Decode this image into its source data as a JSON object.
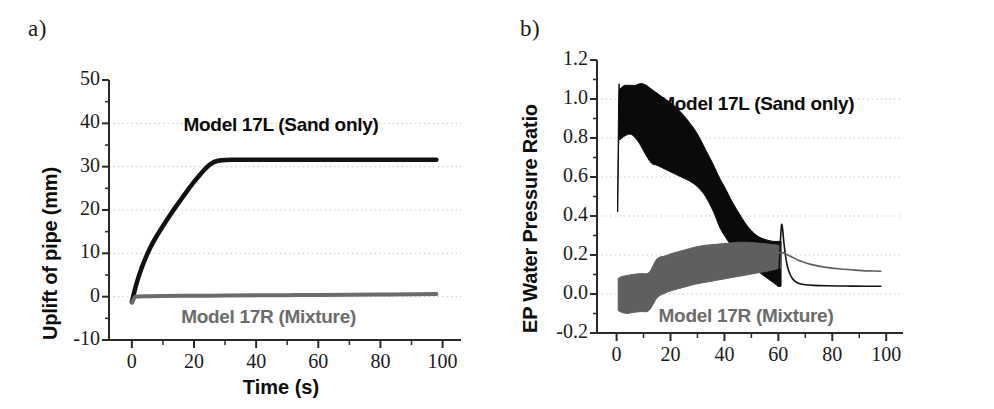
{
  "figure": {
    "panels": [
      {
        "tag": "a)",
        "chart_data": {
          "type": "line",
          "title": "",
          "xlabel": "Time (s)",
          "ylabel": "Uplift of pipe (mm)",
          "xlim": [
            -8,
            104
          ],
          "ylim": [
            -10,
            50
          ],
          "xticks": [
            0,
            20,
            40,
            60,
            80,
            100
          ],
          "xtick_labels": [
            "0",
            "20",
            "40",
            "60",
            "80",
            "100"
          ],
          "xminor_step": 10,
          "yticks": [
            -10,
            0,
            10,
            20,
            30,
            40,
            50
          ],
          "ytick_labels": [
            "-10",
            "0",
            "10",
            "20",
            "30",
            "40",
            "50"
          ],
          "yminor_step": 5,
          "grid": "horizontal-dotted",
          "legend": "inline-annotations",
          "annotations": [
            {
              "text": "Model 17L (Sand only)",
              "x": 48,
              "y": 39.5,
              "color": "#0a0a0a"
            },
            {
              "text": "Model 17R (Mixture)",
              "x": 44,
              "y": -5.0,
              "color": "#6b6b6b"
            }
          ],
          "series": [
            {
              "name": "Model 17L (Sand only)",
              "color": "#111111",
              "width": 4.5,
              "x": [
                0,
                0.6,
                1.5,
                2.5,
                4,
                6,
                8,
                10,
                12,
                14,
                16,
                18,
                20,
                22,
                24,
                26,
                27.5,
                29,
                32,
                36,
                42,
                50,
                60,
                70,
                80,
                90,
                98
              ],
              "y": [
                -1.2,
                0.6,
                3.0,
                5.3,
                8.2,
                11.4,
                14.0,
                16.3,
                18.5,
                20.6,
                22.6,
                24.6,
                26.5,
                28.2,
                29.8,
                30.9,
                31.3,
                31.5,
                31.6,
                31.6,
                31.6,
                31.6,
                31.6,
                31.6,
                31.6,
                31.6,
                31.6
              ]
            },
            {
              "name": "Model 17R (Mixture)",
              "color": "#6b6b6b",
              "width": 4.0,
              "x": [
                0,
                1,
                2,
                5,
                10,
                20,
                30,
                40,
                50,
                60,
                70,
                80,
                90,
                98
              ],
              "y": [
                -1.4,
                -0.1,
                0.05,
                0.1,
                0.15,
                0.2,
                0.25,
                0.3,
                0.35,
                0.4,
                0.45,
                0.5,
                0.55,
                0.6
              ]
            }
          ]
        }
      },
      {
        "tag": "b)",
        "chart_data": {
          "type": "area",
          "title": "",
          "xlabel": "",
          "ylabel": "EP Water Pressure Ratio",
          "xlim": [
            -8,
            104
          ],
          "ylim": [
            -0.2,
            1.2
          ],
          "xticks": [
            0,
            20,
            40,
            60,
            80,
            100
          ],
          "xtick_labels": [
            "0",
            "20",
            "40",
            "60",
            "80",
            "100"
          ],
          "xminor_step": 10,
          "yticks": [
            -0.2,
            0.0,
            0.2,
            0.4,
            0.6,
            0.8,
            1.0,
            1.2
          ],
          "ytick_labels": [
            "-0.2",
            "0.0",
            "0.2",
            "0.4",
            "0.6",
            "0.8",
            "1.0",
            "1.2"
          ],
          "yminor_step": 0.1,
          "grid": "horizontal-dotted",
          "legend": "inline-annotations",
          "annotations": [
            {
              "text": "Model 17L (Sand only)",
              "x": 52,
              "y": 0.97,
              "color": "#0a0a0a"
            },
            {
              "text": "Model 17R (Mixture)",
              "x": 48,
              "y": -0.12,
              "color": "#6b6b6b"
            }
          ],
          "bands": [
            {
              "name": "Model 17L (Sand only)",
              "color": "#0a0a0a",
              "x": [
                0.4,
                0.8,
                1.2,
                2,
                3,
                5,
                7,
                9,
                11,
                13,
                15,
                18,
                21,
                24,
                27,
                30,
                33,
                36,
                38,
                40,
                43,
                46,
                49,
                52,
                55,
                58,
                60,
                61
              ],
              "upper": [
                0.46,
                1.03,
                1.05,
                1.06,
                1.07,
                1.07,
                1.07,
                1.08,
                1.07,
                1.05,
                1.03,
                1.0,
                0.97,
                0.93,
                0.88,
                0.82,
                0.74,
                0.66,
                0.6,
                0.55,
                0.47,
                0.4,
                0.34,
                0.3,
                0.28,
                0.27,
                0.27,
                0.27
              ],
              "lower": [
                0.42,
                0.78,
                0.79,
                0.8,
                0.81,
                0.82,
                0.8,
                0.76,
                0.71,
                0.67,
                0.66,
                0.64,
                0.62,
                0.6,
                0.58,
                0.55,
                0.5,
                0.42,
                0.35,
                0.3,
                0.24,
                0.19,
                0.15,
                0.12,
                0.09,
                0.06,
                0.04,
                0.04
              ]
            },
            {
              "name": "Model 17R (Mixture)",
              "color": "#5f5f5f",
              "x": [
                0.6,
                1.2,
                2,
                4,
                6,
                9,
                12,
                15,
                18,
                21,
                25,
                29,
                33,
                37,
                41,
                45,
                49,
                53,
                57,
                60,
                61
              ],
              "upper": [
                0.08,
                0.085,
                0.09,
                0.095,
                0.1,
                0.105,
                0.11,
                0.18,
                0.195,
                0.21,
                0.225,
                0.24,
                0.25,
                0.255,
                0.26,
                0.265,
                0.265,
                0.26,
                0.255,
                0.25,
                0.25
              ],
              "lower": [
                -0.085,
                -0.09,
                -0.095,
                -0.1,
                -0.095,
                -0.09,
                -0.085,
                -0.02,
                0.005,
                0.02,
                0.035,
                0.05,
                0.06,
                0.07,
                0.08,
                0.09,
                0.1,
                0.11,
                0.12,
                0.13,
                0.13
              ]
            }
          ],
          "series": [
            {
              "name": "Model 17L post-peak decay",
              "color": "#111111",
              "width": 1.6,
              "x": [
                60.0,
                60.4,
                60.8,
                61.2,
                61.6,
                62.0,
                62.6,
                63.3,
                64.2,
                65.2,
                66.5,
                68,
                70,
                73,
                78,
                85,
                92,
                98
              ],
              "y": [
                0.04,
                0.16,
                0.28,
                0.355,
                0.33,
                0.27,
                0.2,
                0.145,
                0.105,
                0.08,
                0.062,
                0.052,
                0.047,
                0.044,
                0.042,
                0.041,
                0.04,
                0.04
              ]
            },
            {
              "name": "Model 17R post-peak decay",
              "color": "#5f5f5f",
              "width": 1.6,
              "x": [
                60.5,
                61.5,
                62.5,
                63.5,
                65,
                67,
                69,
                72,
                75,
                79,
                83,
                87,
                91,
                95,
                98
              ],
              "y": [
                0.212,
                0.212,
                0.207,
                0.2,
                0.19,
                0.176,
                0.165,
                0.152,
                0.143,
                0.134,
                0.128,
                0.124,
                0.12,
                0.118,
                0.117
              ]
            }
          ]
        }
      }
    ]
  }
}
